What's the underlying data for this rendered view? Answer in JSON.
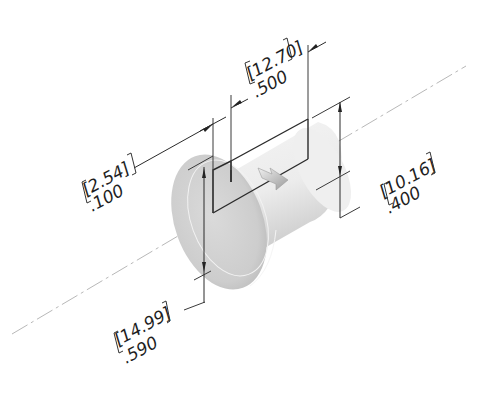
{
  "drawing": {
    "type": "isometric-part-dimension-drawing",
    "part": "cylindrical flanged bushing with rectangular slot",
    "dimensions": [
      {
        "id": "slot-width",
        "metric": "12.70",
        "imperial": ".500",
        "label_metric": "[12.70]",
        "label_imperial": ".500"
      },
      {
        "id": "flange-thickness",
        "metric": "2.54",
        "imperial": ".100",
        "label_metric": "[2.54]",
        "label_imperial": ".100"
      },
      {
        "id": "slot-height",
        "metric": "10.16",
        "imperial": ".400",
        "label_metric": "[10.16]",
        "label_imperial": ".400"
      },
      {
        "id": "overall-height",
        "metric": "14.99",
        "imperial": ".590",
        "label_metric": "[14.99]",
        "label_imperial": ".590"
      }
    ],
    "colors": {
      "line": "#2a2a2a",
      "centerline": "#b8b8b8",
      "part_shade": "#cfcfcf",
      "background": "#ffffff"
    }
  }
}
